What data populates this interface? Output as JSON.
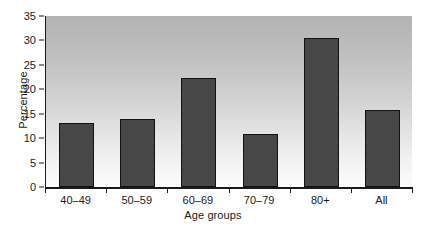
{
  "chart_data": {
    "type": "bar",
    "title": "",
    "xlabel": "Age groups",
    "ylabel": "Percentage",
    "categories": [
      "40–49",
      "50–59",
      "60–69",
      "70–79",
      "80+",
      "All"
    ],
    "values": [
      13.1,
      13.9,
      22.3,
      10.9,
      30.6,
      15.8
    ],
    "ylim": [
      0,
      35
    ],
    "yticks": [
      0,
      5,
      10,
      15,
      20,
      25,
      30,
      35
    ],
    "ytick_labels": [
      "0",
      "5",
      "10",
      "15",
      "20",
      "25",
      "30",
      "35"
    ],
    "grid": false,
    "legend": null,
    "bar_color": "#474747",
    "bar_edge_color": "#121212",
    "plot_background": "gray-vertical-gradient",
    "axis_color": "#1a1a1a"
  }
}
